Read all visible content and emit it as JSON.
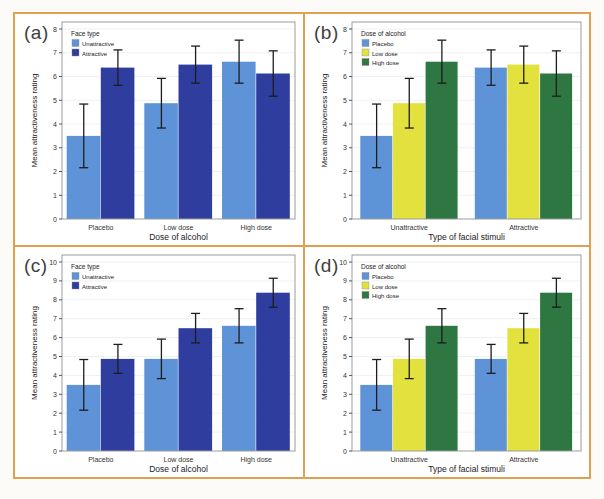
{
  "page": {
    "background": "#fcfbf8",
    "frame_border_color": "#dfa14f",
    "plot_box_border_color": "#9b9b9b",
    "error_bar_color": "#1d1d1d"
  },
  "chart_data": [
    {
      "type": "bar",
      "panel_label": "(a)",
      "title": "",
      "xlabel": "Dose of alcohol",
      "ylabel": "Mean attractiveness rating",
      "ylim": [
        0,
        8
      ],
      "ytick_step": 1,
      "grid": true,
      "legend_title": "Face type",
      "legend_position": "top-left",
      "categories": [
        "Placebo",
        "Low dose",
        "High dose"
      ],
      "series": [
        {
          "name": "Unattractive",
          "color": "#5f93d8",
          "values": [
            3.5,
            4.875,
            6.625
          ],
          "ci_low": [
            2.16,
            3.83,
            5.72
          ],
          "ci_high": [
            4.84,
            5.92,
            7.53
          ]
        },
        {
          "name": "Attractive",
          "color": "#2f3e9e",
          "values": [
            6.375,
            6.5,
            6.125
          ],
          "ci_low": [
            5.63,
            5.72,
            5.17
          ],
          "ci_high": [
            7.12,
            7.28,
            7.08
          ]
        }
      ]
    },
    {
      "type": "bar",
      "panel_label": "(b)",
      "title": "",
      "xlabel": "Type of facial stimuli",
      "ylabel": "Mean attractiveness rating",
      "ylim": [
        0,
        8
      ],
      "ytick_step": 1,
      "grid": true,
      "legend_title": "Dose of alcohol",
      "legend_position": "top-left",
      "categories": [
        "Unattractive",
        "Attractive"
      ],
      "series": [
        {
          "name": "Placebo",
          "color": "#5f93d8",
          "values": [
            3.5,
            6.375
          ],
          "ci_low": [
            2.16,
            5.63
          ],
          "ci_high": [
            4.84,
            7.12
          ]
        },
        {
          "name": "Low dose",
          "color": "#e2e13e",
          "values": [
            4.875,
            6.5
          ],
          "ci_low": [
            3.83,
            5.72
          ],
          "ci_high": [
            5.92,
            7.28
          ]
        },
        {
          "name": "High dose",
          "color": "#2e7742",
          "values": [
            6.625,
            6.125
          ],
          "ci_low": [
            5.72,
            5.17
          ],
          "ci_high": [
            7.53,
            7.08
          ]
        }
      ]
    },
    {
      "type": "bar",
      "panel_label": "(c)",
      "title": "",
      "xlabel": "Dose of alcohol",
      "ylabel": "Mean attractiveness rating",
      "ylim": [
        0,
        10
      ],
      "ytick_step": 1,
      "grid": true,
      "legend_title": "Face type",
      "legend_position": "top-left",
      "categories": [
        "Placebo",
        "Low dose",
        "High dose"
      ],
      "series": [
        {
          "name": "Unattractive",
          "color": "#5f93d8",
          "values": [
            3.5,
            4.875,
            6.625
          ],
          "ci_low": [
            2.16,
            3.83,
            5.72
          ],
          "ci_high": [
            4.84,
            5.92,
            7.53
          ]
        },
        {
          "name": "Attractive",
          "color": "#2f3e9e",
          "values": [
            4.875,
            6.5,
            8.375
          ],
          "ci_low": [
            4.11,
            5.72,
            7.61
          ],
          "ci_high": [
            5.64,
            7.28,
            9.14
          ]
        }
      ]
    },
    {
      "type": "bar",
      "panel_label": "(d)",
      "title": "",
      "xlabel": "Type of facial stimuli",
      "ylabel": "Mean attractiveness rating",
      "ylim": [
        0,
        10
      ],
      "ytick_step": 1,
      "grid": true,
      "legend_title": "Dose of alcohol",
      "legend_position": "top-left",
      "categories": [
        "Unattractive",
        "Attractive"
      ],
      "series": [
        {
          "name": "Placebo",
          "color": "#5f93d8",
          "values": [
            3.5,
            4.875
          ],
          "ci_low": [
            2.16,
            4.11
          ],
          "ci_high": [
            4.84,
            5.64
          ]
        },
        {
          "name": "Low dose",
          "color": "#e2e13e",
          "values": [
            4.875,
            6.5
          ],
          "ci_low": [
            3.83,
            5.72
          ],
          "ci_high": [
            5.92,
            7.28
          ]
        },
        {
          "name": "High dose",
          "color": "#2e7742",
          "values": [
            6.625,
            8.375
          ],
          "ci_low": [
            5.72,
            7.61
          ],
          "ci_high": [
            7.53,
            9.14
          ]
        }
      ]
    }
  ]
}
